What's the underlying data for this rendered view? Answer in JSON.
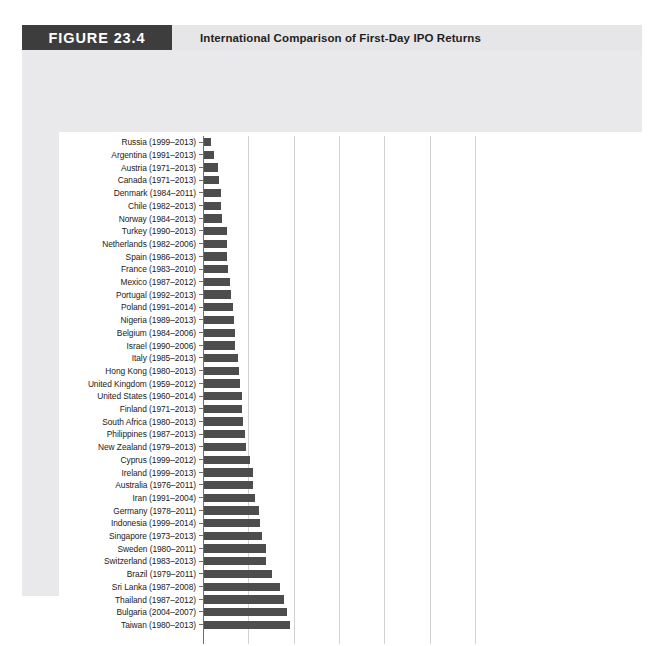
{
  "running_head": "",
  "figure": {
    "number_label": "FIGURE 23.4",
    "title": "International Comparison of First-Day IPO Returns"
  },
  "colors": {
    "bar": "#4d4d4d",
    "gridline": "#d2d2d6",
    "axis": "#6f6f6f",
    "header_block": "#3d3d3d",
    "header_band": "#e6e6e8",
    "frame": "#e9e9eb",
    "panel": "#ffffff"
  },
  "chart_data": {
    "type": "bar",
    "orientation": "horizontal",
    "title": "International Comparison of First-Day IPO Returns",
    "xlabel": "",
    "ylabel": "",
    "xlim": [
      0,
      130
    ],
    "grid": true,
    "gridline_values": [
      20,
      40,
      60,
      80,
      100,
      120
    ],
    "legend": "none",
    "note": "Average first-day IPO return (%) by country over the sample period shown in parentheses. Chart is cropped at the bottom; axis tick labels are not visible in this view.",
    "categories": [
      "Russia  (1999–2013)",
      "Argentina (1991–2013)",
      "Austria (1971–2013)",
      "Canada  (1971–2013)",
      "Denmark (1984–2011)",
      "Chile (1982–2013)",
      "Norway (1984–2013)",
      "Turkey (1990–2013)",
      "Netherlands (1982–2006)",
      "Spain (1986–2013)",
      "France (1983–2010)",
      "Mexico (1987–2012)",
      "Portugal (1992–2013)",
      "Poland (1991–2014)",
      "Nigeria (1989–2013)",
      "Belgium (1984–2006)",
      "Israel (1990–2006)",
      "Italy (1985–2013)",
      "Hong Kong (1980–2013)",
      "United Kingdom (1959–2012)",
      "United States (1960–2014)",
      "Finland (1971–2013)",
      "South Africa (1980–2013)",
      "Philippines (1987–2013)",
      "New Zealand (1979–2013)",
      "Cyprus (1999–2012)",
      "Ireland (1999–2013)",
      "Australia (1976–2011)",
      "Iran (1991–2004)",
      "Germany (1978–2011)",
      "Indonesia (1999–2014)",
      "Singapore (1973–2013)",
      "Sweden (1980–2011)",
      "Switzerland (1983–2013)",
      "Brazil (1979–2011)",
      "Sri Lanka (1987–2008)",
      "Thailand (1987–2012)",
      "Bulgaria (2004–2007)",
      "Taiwan (1980–2013)",
      ""
    ],
    "values": [
      3.3,
      4.6,
      6.4,
      6.5,
      7.4,
      7.6,
      8.1,
      10.0,
      10.2,
      10.3,
      10.5,
      11.6,
      11.9,
      12.7,
      13.1,
      13.5,
      13.8,
      15.2,
      15.4,
      16.0,
      16.9,
      16.9,
      17.4,
      18.1,
      18.6,
      20.3,
      21.6,
      21.8,
      22.4,
      24.2,
      24.9,
      25.8,
      27.2,
      27.3,
      30.1,
      33.5,
      35.1,
      36.5,
      38.1,
      0
    ]
  }
}
